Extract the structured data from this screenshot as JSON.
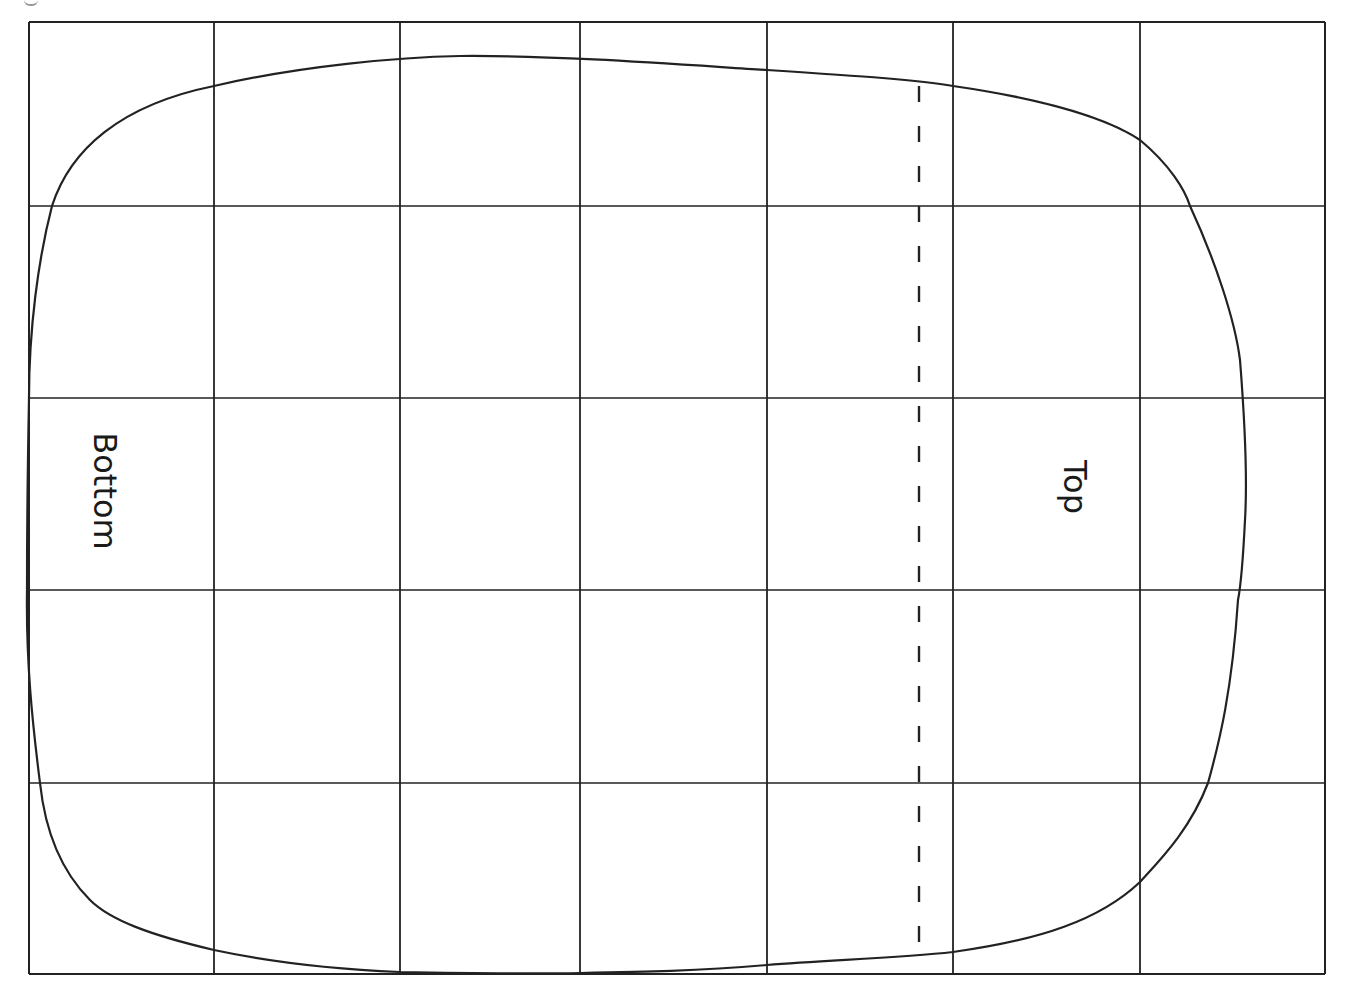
{
  "figure": {
    "background_color": "#ffffff",
    "line_color": "#222222",
    "grid": {
      "columns": 7,
      "rows": 5,
      "x_lines": [
        29,
        214,
        400,
        580,
        767,
        953,
        1140,
        1325
      ],
      "y_lines": [
        22,
        206,
        398,
        590,
        783,
        974
      ]
    },
    "outline": {
      "shape": "rounded-rectangle (hand-drawn)",
      "path": "M 214 86 C 300 66, 400 57, 460 56 C 560 55, 700 66, 767 70 C 860 76, 920 80, 953 86 C 1050 100, 1110 120, 1140 140 C 1170 165, 1185 190, 1190 206 C 1215 260, 1235 320, 1240 360 C 1243 398, 1248 470, 1245 520 C 1243 560, 1240 590, 1238 600 C 1232 690, 1220 740, 1208 783 C 1190 830, 1160 860, 1140 882 C 1100 920, 1040 940, 953 952 C 900 958, 830 960, 767 965 C 700 971, 640 972, 580 973 C 520 974, 460 973, 400 972 C 330 969, 270 962, 214 950 C 150 935, 110 920, 90 900 C 60 870, 45 830, 40 783 C 32 720, 26 660, 27 590 C 27 520, 28 450, 29 398 C 29 330, 38 260, 52 206 C 70 150, 120 105, 214 86 Z"
    },
    "dashed_line": {
      "x": 919,
      "y_start": 86,
      "y_end": 952,
      "dash": "16 24"
    },
    "labels": {
      "bottom": "Bottom",
      "top": "Top"
    }
  }
}
